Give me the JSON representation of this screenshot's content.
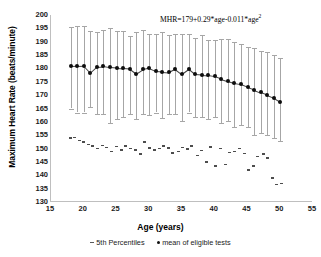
{
  "chart_data": {
    "type": "scatter",
    "title": "",
    "xlabel": "Age (years)",
    "ylabel": "Maximum Heart Rate (beats/minute)",
    "xlim": [
      15,
      55
    ],
    "ylim": [
      130,
      200
    ],
    "xticks": [
      15,
      20,
      25,
      30,
      35,
      40,
      45,
      50,
      55
    ],
    "yticks": [
      130,
      135,
      140,
      145,
      150,
      155,
      160,
      165,
      170,
      175,
      180,
      185,
      190,
      195,
      200
    ],
    "grid": false,
    "legend_position": "bottom",
    "annotation": "MHR=179+0.29*age-0.011*age",
    "annotation_exponent": "2",
    "legend": [
      {
        "marker": "dash",
        "label": "5th Percentiles"
      },
      {
        "marker": "dot",
        "label": "mean of eligible tests"
      }
    ],
    "series": [
      {
        "name": "mean of eligible tests",
        "marker": "dot",
        "x": [
          18,
          19,
          20,
          21,
          22,
          23,
          24,
          25,
          26,
          27,
          28,
          29,
          30,
          31,
          32,
          33,
          34,
          35,
          36,
          37,
          38,
          39,
          40,
          41,
          42,
          43,
          44,
          45,
          46,
          47,
          48,
          49,
          50
        ],
        "values": [
          180.8,
          180.9,
          181.0,
          178.4,
          180.6,
          180.8,
          180.4,
          180.2,
          180.0,
          179.8,
          178.0,
          179.6,
          180.1,
          179.0,
          178.8,
          178.6,
          179.9,
          178.0,
          179.8,
          177.8,
          177.6,
          177.4,
          177.0,
          176.0,
          175.2,
          174.4,
          174.0,
          173.0,
          172.0,
          171.0,
          170.0,
          169.0,
          167.5
        ],
        "err_low": [
          165.0,
          163.5,
          163.5,
          165.5,
          163.0,
          163.0,
          159.5,
          161.0,
          162.0,
          163.0,
          161.0,
          163.0,
          162.5,
          163.5,
          161.5,
          163.0,
          163.0,
          160.5,
          163.5,
          162.0,
          162.0,
          161.0,
          162.0,
          159.5,
          160.5,
          158.0,
          159.0,
          158.0,
          155.0,
          156.0,
          155.0,
          154.0,
          153.0
        ],
        "err_high": [
          195.5,
          196.0,
          196.0,
          194.0,
          193.5,
          194.5,
          195.0,
          194.0,
          194.0,
          192.0,
          193.5,
          194.5,
          193.0,
          193.0,
          193.5,
          192.5,
          193.0,
          193.0,
          193.0,
          191.5,
          192.5,
          190.5,
          190.5,
          191.0,
          191.0,
          190.0,
          189.0,
          188.0,
          187.5,
          186.5,
          186.0,
          185.0,
          184.0
        ]
      },
      {
        "name": "5th Percentiles",
        "marker": "dash",
        "x": [
          18,
          18.6,
          19.3,
          20.0,
          20.8,
          21.4,
          22.1,
          22.8,
          23.5,
          24.2,
          25.0,
          25.7,
          26.4,
          27.1,
          27.9,
          28.6,
          29.3,
          30.0,
          30.8,
          31.5,
          32.2,
          32.9,
          33.6,
          34.4,
          35.1,
          35.8,
          36.5,
          37.3,
          38.0,
          38.7,
          39.4,
          40.1,
          40.9,
          41.6,
          42.3,
          43.0,
          43.8,
          44.5,
          45.2,
          45.9,
          46.6,
          47.4,
          48.1,
          48.8,
          49.5,
          50.2
        ],
        "values": [
          154.0,
          154.2,
          153.0,
          152.5,
          151.5,
          151.0,
          150.0,
          151.2,
          150.5,
          149.0,
          150.8,
          149.5,
          151.0,
          150.0,
          149.4,
          148.0,
          152.5,
          150.2,
          149.5,
          150.0,
          151.0,
          150.2,
          148.3,
          149.0,
          150.4,
          149.8,
          151.0,
          147.5,
          149.2,
          145.0,
          150.6,
          143.5,
          150.0,
          144.0,
          148.5,
          149.0,
          150.0,
          148.2,
          142.0,
          143.5,
          147.0,
          148.0,
          146.5,
          139.0,
          136.5,
          137.0
        ]
      }
    ]
  }
}
